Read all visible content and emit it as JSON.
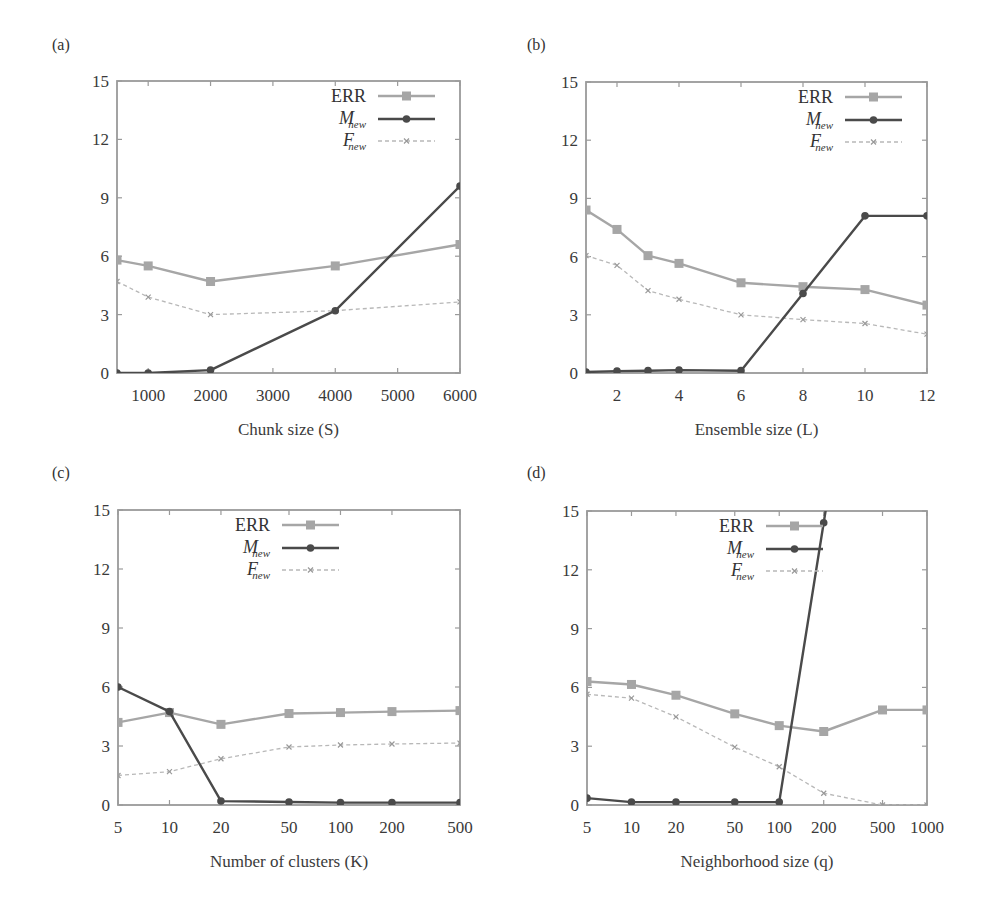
{
  "legend": {
    "err": "ERR",
    "m_main": "M",
    "m_sub": "new",
    "f_main": "F",
    "f_sub": "new"
  },
  "colors": {
    "err": "#a6a6a6",
    "m_new": "#4a4a4a",
    "f_new": "#b8b8b8",
    "frame": "#9a9a9a"
  },
  "chart_data": [
    {
      "panel": "(a)",
      "type": "line",
      "xlabel": "Chunk size (S)",
      "ylabel": "",
      "xscale": "linear",
      "xlim": [
        500,
        6000
      ],
      "ylim": [
        0,
        15
      ],
      "yticks": [
        0,
        3,
        6,
        9,
        12,
        15
      ],
      "xticks": [
        1000,
        2000,
        3000,
        4000,
        5000,
        6000
      ],
      "legend_position": "top-right",
      "x": [
        500,
        1000,
        2000,
        4000,
        6000
      ],
      "series": [
        {
          "name": "ERR",
          "values": [
            5.8,
            5.5,
            4.7,
            5.5,
            6.6
          ]
        },
        {
          "name": "M_new",
          "values": [
            0.0,
            0.0,
            0.15,
            3.2,
            9.6
          ]
        },
        {
          "name": "F_new",
          "values": [
            4.7,
            3.9,
            3.0,
            3.2,
            3.65
          ]
        }
      ]
    },
    {
      "panel": "(b)",
      "type": "line",
      "xlabel": "Ensemble size (L)",
      "ylabel": "",
      "xscale": "linear",
      "xlim": [
        1,
        12
      ],
      "ylim": [
        0,
        15
      ],
      "yticks": [
        0,
        3,
        6,
        9,
        12,
        15
      ],
      "xticks": [
        2,
        4,
        6,
        8,
        10,
        12
      ],
      "legend_position": "top-right",
      "x": [
        1,
        2,
        3,
        4,
        6,
        8,
        10,
        12
      ],
      "series": [
        {
          "name": "ERR",
          "values": [
            8.4,
            7.4,
            6.05,
            5.65,
            4.65,
            4.45,
            4.3,
            3.5
          ]
        },
        {
          "name": "M_new",
          "values": [
            0.05,
            0.1,
            0.12,
            0.15,
            0.12,
            4.1,
            8.1,
            8.1
          ]
        },
        {
          "name": "F_new",
          "values": [
            6.05,
            5.55,
            4.25,
            3.8,
            3.0,
            2.75,
            2.55,
            2.0
          ]
        }
      ]
    },
    {
      "panel": "(c)",
      "type": "line",
      "xlabel": "Number of clusters (K)",
      "ylabel": "",
      "xscale": "log",
      "xlim": [
        5,
        500
      ],
      "ylim": [
        0,
        15
      ],
      "yticks": [
        0,
        3,
        6,
        9,
        12,
        15
      ],
      "xticks": [
        5,
        10,
        20,
        50,
        100,
        200,
        500
      ],
      "legend_position": "top-center",
      "x": [
        5,
        10,
        20,
        50,
        100,
        200,
        500
      ],
      "series": [
        {
          "name": "ERR",
          "values": [
            4.2,
            4.7,
            4.1,
            4.65,
            4.7,
            4.75,
            4.8
          ]
        },
        {
          "name": "M_new",
          "values": [
            6.0,
            4.75,
            0.2,
            0.15,
            0.12,
            0.12,
            0.12
          ]
        },
        {
          "name": "F_new",
          "values": [
            1.5,
            1.7,
            2.35,
            2.95,
            3.05,
            3.1,
            3.15
          ]
        }
      ]
    },
    {
      "panel": "(d)",
      "type": "line",
      "xlabel": "Neighborhood size (q)",
      "ylabel": "",
      "xscale": "log",
      "xlim": [
        5,
        1000
      ],
      "ylim": [
        0,
        15
      ],
      "yticks": [
        0,
        3,
        6,
        9,
        12,
        15
      ],
      "xticks": [
        5,
        10,
        20,
        50,
        100,
        200,
        500,
        1000
      ],
      "legend_position": "top-center",
      "x": [
        5,
        10,
        20,
        50,
        100,
        200,
        500,
        1000
      ],
      "series": [
        {
          "name": "ERR",
          "values": [
            6.3,
            6.15,
            5.6,
            4.65,
            4.05,
            3.75,
            4.85,
            4.85
          ]
        },
        {
          "name": "M_new",
          "values": [
            0.35,
            0.15,
            0.15,
            0.15,
            0.15,
            14.4,
            null,
            null
          ],
          "note": "line exits above y=15 after q=200"
        },
        {
          "name": "F_new",
          "values": [
            5.65,
            5.45,
            4.5,
            2.95,
            1.95,
            0.6,
            0.0,
            0.0
          ]
        }
      ]
    }
  ]
}
